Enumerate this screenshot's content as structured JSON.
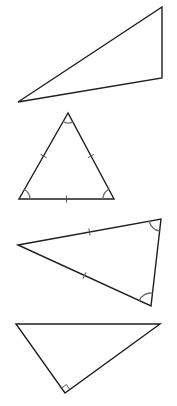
{
  "diagram": {
    "title": "",
    "background": "#ffffff",
    "line_color": "#1e1e1e",
    "mark_color": "#6a6a6a",
    "triangles": [
      {
        "id": "scalene-triangle",
        "type": "scalene",
        "vertices": [
          [
            162,
            7
          ],
          [
            162,
            78
          ],
          [
            18,
            102
          ]
        ],
        "tick_marks": [],
        "angle_arcs": [],
        "right_angle": null
      },
      {
        "id": "equilateral-triangle",
        "type": "equilateral",
        "vertices": [
          [
            68,
            113
          ],
          [
            19,
            199
          ],
          [
            114,
            199
          ]
        ],
        "tick_marks": [
          {
            "side": [
              0,
              1
            ],
            "count": 1
          },
          {
            "side": [
              0,
              2
            ],
            "count": 1
          },
          {
            "side": [
              1,
              2
            ],
            "count": 1
          }
        ],
        "angle_arcs": [
          {
            "vertex": 0,
            "radius": 10
          },
          {
            "vertex": 1,
            "radius": 11
          },
          {
            "vertex": 2,
            "radius": 11
          }
        ],
        "right_angle": null
      },
      {
        "id": "isosceles-triangle",
        "type": "isosceles",
        "vertices": [
          [
            18,
            245
          ],
          [
            161,
            219
          ],
          [
            151,
            306
          ]
        ],
        "tick_marks": [
          {
            "side": [
              0,
              1
            ],
            "count": 1
          },
          {
            "side": [
              0,
              2
            ],
            "count": 1
          }
        ],
        "angle_arcs": [
          {
            "vertex": 1,
            "radius": 12
          },
          {
            "vertex": 2,
            "radius": 13
          }
        ],
        "right_angle": null
      },
      {
        "id": "right-triangle",
        "type": "right",
        "vertices": [
          [
            16,
            324
          ],
          [
            160,
            324
          ],
          [
            65,
            393
          ]
        ],
        "tick_marks": [],
        "angle_arcs": [],
        "right_angle": {
          "vertex": 2,
          "size": 6
        }
      }
    ]
  }
}
